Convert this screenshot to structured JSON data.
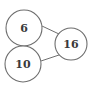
{
  "diagram": {
    "type": "number-bond",
    "whole": {
      "label": "16"
    },
    "parts": [
      {
        "label": "6"
      },
      {
        "label": "10"
      }
    ],
    "colors": {
      "stroke": "#6e6e6e",
      "text": "#3a3a3a",
      "background": "#ffffff"
    }
  }
}
